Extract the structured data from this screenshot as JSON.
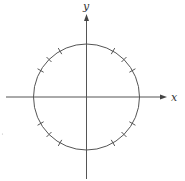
{
  "diagram": {
    "type": "unit-circle",
    "axes": {
      "x_label": "x",
      "y_label": "y"
    },
    "circle": {
      "center_px": [
        86.5,
        97
      ],
      "radius_px": 53
    },
    "tick_angles_deg": [
      30,
      45,
      60,
      120,
      135,
      150,
      210,
      225,
      240,
      300,
      315,
      330
    ],
    "colors": {
      "stroke": "#555555",
      "label": "#333333",
      "background": "#ffffff"
    }
  }
}
